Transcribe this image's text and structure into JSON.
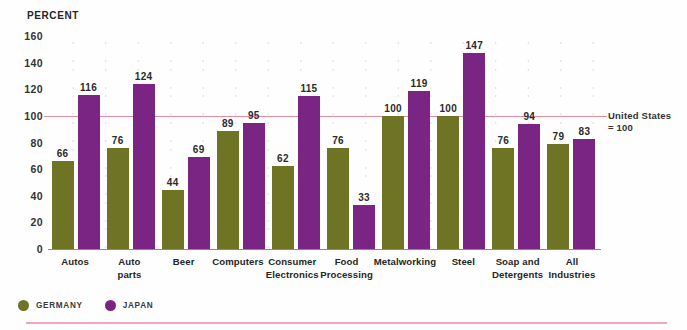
{
  "header": {
    "percent_label": "PERCENT"
  },
  "reference": {
    "line1": "United States",
    "line2": "= 100",
    "value": 100,
    "color": "#e88aa0"
  },
  "legend": {
    "items": [
      {
        "label": "GERMANY",
        "color": "#6e7424",
        "icon": "circle-marker-icon"
      },
      {
        "label": "JAPAN",
        "color": "#7a2583",
        "icon": "circle-marker-icon"
      }
    ]
  },
  "chart_data": {
    "type": "bar",
    "title": "PERCENT",
    "xlabel": "",
    "ylabel": "PERCENT",
    "ylim": [
      0,
      160
    ],
    "yticks": [
      0,
      20,
      40,
      60,
      80,
      100,
      120,
      140,
      160
    ],
    "ytick_labels": [
      "0",
      "20",
      "40",
      "60",
      "80",
      "100",
      "120",
      "140",
      "160"
    ],
    "grid": "dotted",
    "legend_position": "bottom-left",
    "reference_line": {
      "value": 100,
      "label": "United States = 100"
    },
    "categories": [
      "Autos",
      "Auto parts",
      "Beer",
      "Computers",
      "Consumer Electronics",
      "Food Processing",
      "Metalworking",
      "Steel",
      "Soap and Detergents",
      "All Industries"
    ],
    "category_lines": [
      [
        "Autos"
      ],
      [
        "Auto",
        "parts"
      ],
      [
        "Beer"
      ],
      [
        "Computers"
      ],
      [
        "Consumer",
        "Electronics"
      ],
      [
        "Food",
        "Processing"
      ],
      [
        "Metalworking"
      ],
      [
        "Steel"
      ],
      [
        "Soap and",
        "Detergents"
      ],
      [
        "All",
        "Industries"
      ]
    ],
    "series": [
      {
        "name": "GERMANY",
        "color": "#6e7424",
        "values": [
          66,
          76,
          44,
          89,
          62,
          76,
          100,
          100,
          76,
          79
        ]
      },
      {
        "name": "JAPAN",
        "color": "#7a2583",
        "values": [
          116,
          124,
          69,
          95,
          115,
          33,
          119,
          147,
          94,
          83
        ]
      }
    ]
  }
}
